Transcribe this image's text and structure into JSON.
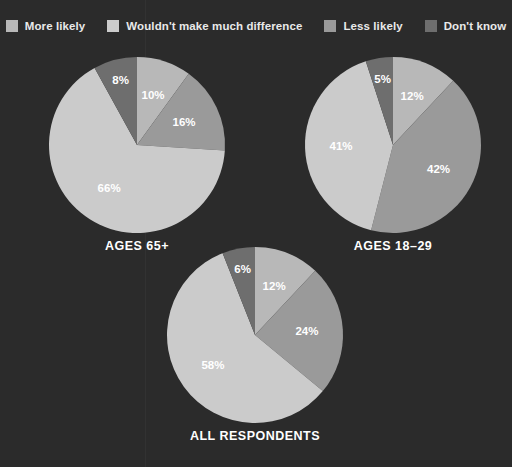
{
  "background_color": "#2b2b2b",
  "legend": {
    "items": [
      {
        "label": "More likely",
        "color": "#b8b8b8",
        "icon": "legend-swatch"
      },
      {
        "label": "Wouldn't make much difference",
        "color": "#cbcbcb",
        "icon": "legend-swatch"
      },
      {
        "label": "Less likely",
        "color": "#9a9a9a",
        "icon": "legend-swatch"
      },
      {
        "label": "Don't know",
        "color": "#6e6e6e",
        "icon": "legend-swatch"
      }
    ]
  },
  "chart_data": {
    "type": "pie",
    "title": "",
    "legend_position": "top",
    "categories": [
      "More likely",
      "Wouldn't make much difference",
      "Less likely",
      "Don't know"
    ],
    "colors": [
      "#b8b8b8",
      "#cbcbcb",
      "#9a9a9a",
      "#6e6e6e"
    ],
    "value_suffix": "%",
    "charts": [
      {
        "title": "AGES 65+",
        "slices": [
          {
            "category": "More likely",
            "value": 10,
            "label": "10%",
            "color": "#b8b8b8"
          },
          {
            "category": "Less likely",
            "value": 16,
            "label": "16%",
            "color": "#9a9a9a"
          },
          {
            "category": "Wouldn't make much difference",
            "value": 66,
            "label": "66%",
            "color": "#cbcbcb"
          },
          {
            "category": "Don't know",
            "value": 8,
            "label": "8%",
            "color": "#6e6e6e"
          }
        ]
      },
      {
        "title": "AGES 18–29",
        "slices": [
          {
            "category": "More likely",
            "value": 12,
            "label": "12%",
            "color": "#b8b8b8"
          },
          {
            "category": "Less likely",
            "value": 42,
            "label": "42%",
            "color": "#9a9a9a"
          },
          {
            "category": "Wouldn't make much difference",
            "value": 41,
            "label": "41%",
            "color": "#cbcbcb"
          },
          {
            "category": "Don't know",
            "value": 5,
            "label": "5%",
            "color": "#6e6e6e"
          }
        ]
      },
      {
        "title": "ALL RESPONDENTS",
        "slices": [
          {
            "category": "More likely",
            "value": 12,
            "label": "12%",
            "color": "#b8b8b8"
          },
          {
            "category": "Less likely",
            "value": 24,
            "label": "24%",
            "color": "#9a9a9a"
          },
          {
            "category": "Wouldn't make much difference",
            "value": 58,
            "label": "58%",
            "color": "#cbcbcb"
          },
          {
            "category": "Don't know",
            "value": 6,
            "label": "6%",
            "color": "#6e6e6e"
          }
        ]
      }
    ]
  }
}
